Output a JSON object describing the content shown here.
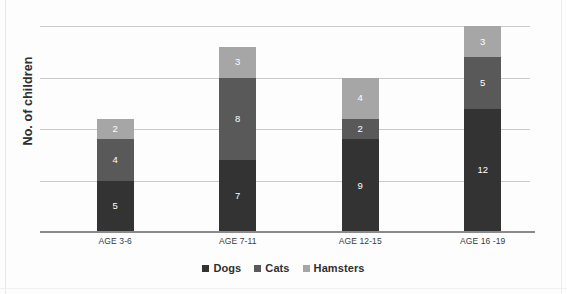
{
  "chart_data": {
    "type": "bar",
    "subtype": "stacked-bar",
    "title": "",
    "xlabel": "",
    "ylabel": "No. of children",
    "categories": [
      "AGE 3-6",
      "AGE 7-11",
      "AGE 12-15",
      "AGE 16 -19"
    ],
    "series": [
      {
        "name": "Dogs",
        "color": "#333333",
        "values": [
          5,
          7,
          9,
          12
        ]
      },
      {
        "name": "Cats",
        "color": "#595959",
        "values": [
          4,
          8,
          2,
          5
        ]
      },
      {
        "name": "Hamsters",
        "color": "#a6a6a6",
        "values": [
          2,
          3,
          4,
          3
        ]
      }
    ],
    "stack_totals": [
      11,
      18,
      15,
      20
    ],
    "ylim": [
      0,
      21
    ],
    "y_gridline_values": [
      5,
      10,
      15,
      20
    ],
    "y_tick_labels_visible": false,
    "grid": true,
    "legend_position": "bottom",
    "data_labels": true,
    "bar_value_label_color": "#ffffff",
    "gridline_color": "#c9c9c9",
    "axis_color": "#8a8a8a",
    "background_color": "#fdfdfd"
  },
  "axis": {
    "y_title": "No. of children"
  },
  "legend": {
    "items": [
      {
        "label": "Dogs"
      },
      {
        "label": "Cats"
      },
      {
        "label": "Hamsters"
      }
    ]
  }
}
